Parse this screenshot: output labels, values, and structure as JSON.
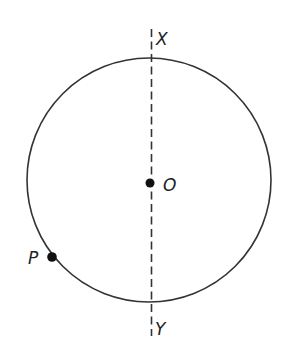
{
  "diagram": {
    "labels": {
      "top": "X",
      "bottom": "Y",
      "center": "O",
      "point": "P"
    },
    "colors": {
      "stroke": "#333333",
      "point": "#111111",
      "background": "#ffffff"
    }
  }
}
